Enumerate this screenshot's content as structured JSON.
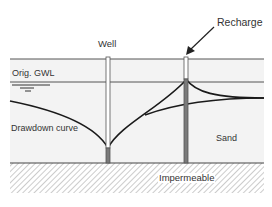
{
  "diagram": {
    "labels": {
      "well": "Well",
      "recharge": "Recharge",
      "orig_gwl": "Orig. GWL",
      "drawdown_curve": "Drawdown curve",
      "sand": "Sand",
      "impermeable": "Impermeable"
    },
    "colors": {
      "aquifer_fill": "#f2f2f2",
      "line": "#555555",
      "curve": "#1a1a1a",
      "well_casing": "#ffffff",
      "well_screen": "#7a7a7a",
      "hatch": "#9a9a9a"
    }
  }
}
